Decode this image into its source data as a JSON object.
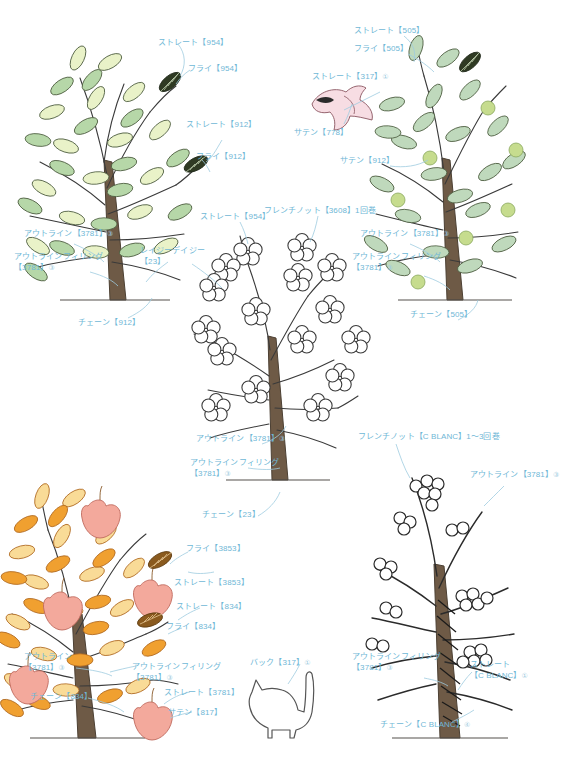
{
  "page": {
    "accent_color": "#6FB7D6",
    "ink_color": "#3a3a3a",
    "background": "#ffffff"
  },
  "palette": {
    "leaf_green_light": "#E9F2C8",
    "leaf_green_mid": "#B6D7A8",
    "leaf_sage": "#BFD9BC",
    "olive_berry": "#C6DC8E",
    "dark_leaf": "#2F3A23",
    "trunk_brown": "#6E5A46",
    "autumn_orange": "#F0A030",
    "autumn_yellow": "#F9DB97",
    "apple_pink": "#F3A99C",
    "bird_pink": "#F7DDE3"
  },
  "motifs": [
    {
      "id": "tree-green-left",
      "name": "緑の木（左上）",
      "labels": [
        {
          "key": "straight-954",
          "text": "ストレート【954】",
          "sup": ""
        },
        {
          "key": "fly-954",
          "text": "フライ【954】",
          "sup": ""
        },
        {
          "key": "straight-912",
          "text": "ストレート【912】",
          "sup": ""
        },
        {
          "key": "fly-912",
          "text": "フライ【912】",
          "sup": ""
        },
        {
          "key": "outline-3781",
          "text": "アウトライン【3781】",
          "sup": "③"
        },
        {
          "key": "outline-filling-3781",
          "text": "アウトラインフィリング",
          "text2": "【3781】",
          "sup": "③"
        },
        {
          "key": "chain-912",
          "text": "チェーン【912】",
          "sup": ""
        }
      ]
    },
    {
      "id": "tree-green-right",
      "name": "緑の木（右上）",
      "labels": [
        {
          "key": "straight-505",
          "text": "ストレート【505】",
          "sup": ""
        },
        {
          "key": "fly-505",
          "text": "フライ【505】",
          "sup": ""
        },
        {
          "key": "satin-912",
          "text": "サテン【912】",
          "sup": ""
        },
        {
          "key": "outline-3781",
          "text": "アウトライン【3781】",
          "sup": "③"
        },
        {
          "key": "outline-filling-3781",
          "text": "アウトラインフィリング",
          "text2": "【3781】",
          "sup": "③"
        },
        {
          "key": "chain-505",
          "text": "チェーン【505】",
          "sup": ""
        }
      ]
    },
    {
      "id": "bird",
      "name": "小鳥",
      "labels": [
        {
          "key": "straight-317",
          "text": "ストレート【317】",
          "sup": "①"
        },
        {
          "key": "satin-778",
          "text": "サテン【778】",
          "sup": ""
        }
      ]
    },
    {
      "id": "tree-flower",
      "name": "花の木（中央）",
      "labels": [
        {
          "key": "french-knot-3608",
          "text": "フレンチノット【3608】1回巻",
          "sup": ""
        },
        {
          "key": "straight-954",
          "text": "ストレート【954】",
          "sup": ""
        },
        {
          "key": "lazy-daisy-23",
          "text": "レイジーデイジー",
          "text2": "【23】",
          "sup": ""
        },
        {
          "key": "outline-3781",
          "text": "アウトライン【3781】",
          "sup": "③"
        },
        {
          "key": "outline-filling-3781",
          "text": "アウトラインフィリング",
          "text2": "【3781】",
          "sup": "③"
        },
        {
          "key": "chain-23",
          "text": "チェーン【23】",
          "sup": ""
        }
      ]
    },
    {
      "id": "tree-autumn",
      "name": "紅葉の木（左下）",
      "labels": [
        {
          "key": "fly-3853",
          "text": "フライ【3853】",
          "sup": ""
        },
        {
          "key": "straight-3853",
          "text": "ストレート【3853】",
          "sup": ""
        },
        {
          "key": "straight-834",
          "text": "ストレート【834】",
          "sup": ""
        },
        {
          "key": "fly-834",
          "text": "フライ【834】",
          "sup": ""
        },
        {
          "key": "outline-3781",
          "text": "アウトライン",
          "text2": "【3781】",
          "sup": "③"
        },
        {
          "key": "outline-filling-3781",
          "text": "アウトラインフィリング",
          "text2": "【3781】",
          "sup": "③"
        },
        {
          "key": "chain-834",
          "text": "チェーン【834】",
          "sup": ""
        },
        {
          "key": "straight-3781",
          "text": "ストレート【3781】",
          "sup": ""
        },
        {
          "key": "satin-817",
          "text": "サテン【817】",
          "sup": ""
        }
      ]
    },
    {
      "id": "cat",
      "name": "猫",
      "labels": [
        {
          "key": "back-317",
          "text": "バック【317】",
          "sup": "①"
        }
      ]
    },
    {
      "id": "tree-berry",
      "name": "実の木（右下）",
      "labels": [
        {
          "key": "french-knot-blanc",
          "text": "フレンチノット【C BLANC】1〜3回巻",
          "sup": ""
        },
        {
          "key": "outline-3781",
          "text": "アウトライン【3781】",
          "sup": "③"
        },
        {
          "key": "outline-filling-3781",
          "text": "アウトラインフィリング",
          "text2": "【3781】",
          "sup": "③"
        },
        {
          "key": "straight-blanc",
          "text": "ストレート",
          "text2": "【C BLANC】",
          "sup": "①"
        },
        {
          "key": "chain-blanc",
          "text": "チェーン【C BLANC】",
          "sup": "④"
        }
      ]
    }
  ]
}
